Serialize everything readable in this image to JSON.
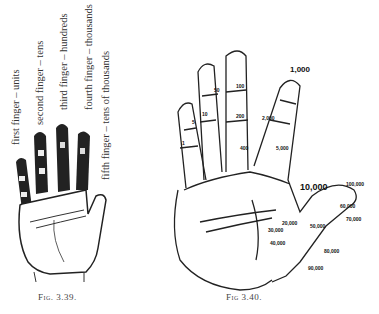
{
  "figure_39": {
    "caption": "Fig. 3.39.",
    "labels": [
      "first finger – units",
      "second finger – tens",
      "third finger – hundreds",
      "fourth finger – thousands",
      "fifth finger – tens of thousands"
    ]
  },
  "figure_40": {
    "caption": "Fig 3.40.",
    "finger_marks": {
      "first": [
        "1",
        "5",
        "10"
      ],
      "second": [
        "10",
        "50",
        "40",
        "60",
        "90"
      ],
      "third": [
        "100",
        "200",
        "400",
        "300",
        "500",
        "600",
        "800"
      ],
      "fourth": [
        "1,000",
        "3,000",
        "2,000",
        "4,000",
        "5,000",
        "6,000",
        "7,000",
        "8,000",
        "9,000"
      ],
      "thumb_palm": [
        "10,000",
        "100,000",
        "20,000",
        "30,000",
        "40,000",
        "50,000",
        "60,000",
        "70,000",
        "80,000",
        "90,000"
      ]
    }
  }
}
